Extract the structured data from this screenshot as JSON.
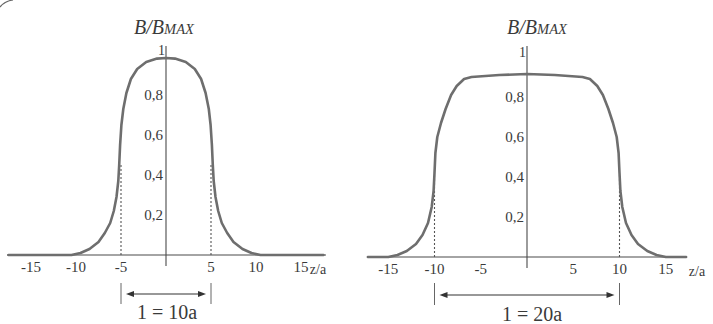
{
  "figure": {
    "corner_fragment": "circled-label-fragment"
  },
  "chart_data": [
    {
      "type": "line",
      "title": "B/B_MAX",
      "title_base": "B/B",
      "title_sub": "MAX",
      "ylabel": "B/B_MAX",
      "xlabel": "z/a",
      "x_ticks": [
        -15,
        -10,
        -5,
        5,
        10,
        15
      ],
      "x_tick_labels": [
        "-15",
        "-10",
        "-5",
        "5",
        "10",
        "15"
      ],
      "y_ticks": [
        0.2,
        0.4,
        0.6,
        0.8,
        1
      ],
      "y_tick_labels": [
        "0,2",
        "0,4",
        "0,6",
        "0,8",
        "1"
      ],
      "xlim": [
        -17.5,
        17.5
      ],
      "ylim": [
        0,
        1
      ],
      "grid": false,
      "markers": [
        -5,
        5
      ],
      "marker_height": 0.45,
      "length_annotation": "1 = 10a",
      "series": [
        {
          "name": "B/B_MAX (l = 10a)",
          "x": [
            -17.5,
            -10.5,
            -9.5,
            -8.5,
            -7.5,
            -6.8,
            -6.2,
            -5.8,
            -5.5,
            -5.3,
            -5.2,
            -5.1,
            -4.95,
            -4.75,
            -4.4,
            -3.9,
            -3.2,
            -2.2,
            -1.0,
            0,
            1.0,
            2.2,
            3.2,
            3.9,
            4.4,
            4.75,
            4.95,
            5.1,
            5.2,
            5.3,
            5.5,
            5.8,
            6.2,
            6.8,
            7.5,
            8.5,
            9.5,
            10.5,
            17.5
          ],
          "y": [
            0,
            0,
            0.01,
            0.03,
            0.065,
            0.11,
            0.16,
            0.22,
            0.29,
            0.37,
            0.45,
            0.55,
            0.65,
            0.73,
            0.81,
            0.88,
            0.93,
            0.965,
            0.982,
            0.985,
            0.982,
            0.965,
            0.93,
            0.88,
            0.81,
            0.73,
            0.65,
            0.55,
            0.45,
            0.37,
            0.29,
            0.22,
            0.16,
            0.11,
            0.065,
            0.03,
            0.01,
            0,
            0
          ]
        }
      ]
    },
    {
      "type": "line",
      "title": "B/B_MAX",
      "title_base": "B/B",
      "title_sub": "MAX",
      "ylabel": "B/B_MAX",
      "xlabel": "z/a",
      "x_ticks": [
        -15,
        -10,
        -5,
        5,
        10,
        15
      ],
      "x_tick_labels": [
        "-15",
        "-10",
        "-5",
        "5",
        "10",
        "15"
      ],
      "y_ticks": [
        0.2,
        0.4,
        0.6,
        0.8,
        1
      ],
      "y_tick_labels": [
        "0,2",
        "0,4",
        "0,6",
        "0,8",
        "1"
      ],
      "xlim": [
        -17.2,
        17.2
      ],
      "ylim": [
        0,
        1
      ],
      "grid": false,
      "markers": [
        -10,
        10
      ],
      "marker_height": 0.42,
      "length_annotation": "1 = 20a",
      "series": [
        {
          "name": "B/B_MAX (l = 20a)",
          "x": [
            -17.2,
            -15,
            -14,
            -13,
            -12,
            -11.3,
            -10.7,
            -10.3,
            -10.1,
            -10.0,
            -9.9,
            -9.7,
            -9.3,
            -8.8,
            -8.2,
            -7.6,
            -6.8,
            -6,
            -3,
            0,
            3,
            6,
            6.8,
            7.6,
            8.2,
            8.8,
            9.3,
            9.7,
            9.9,
            10.0,
            10.1,
            10.3,
            10.7,
            11.3,
            12,
            13,
            14,
            15,
            17.2
          ],
          "y": [
            0,
            0,
            0.01,
            0.03,
            0.065,
            0.11,
            0.17,
            0.25,
            0.33,
            0.42,
            0.52,
            0.6,
            0.67,
            0.74,
            0.81,
            0.855,
            0.89,
            0.9,
            0.91,
            0.915,
            0.91,
            0.9,
            0.89,
            0.855,
            0.81,
            0.74,
            0.67,
            0.6,
            0.52,
            0.42,
            0.33,
            0.25,
            0.17,
            0.11,
            0.065,
            0.03,
            0.01,
            0,
            0
          ]
        }
      ]
    }
  ]
}
